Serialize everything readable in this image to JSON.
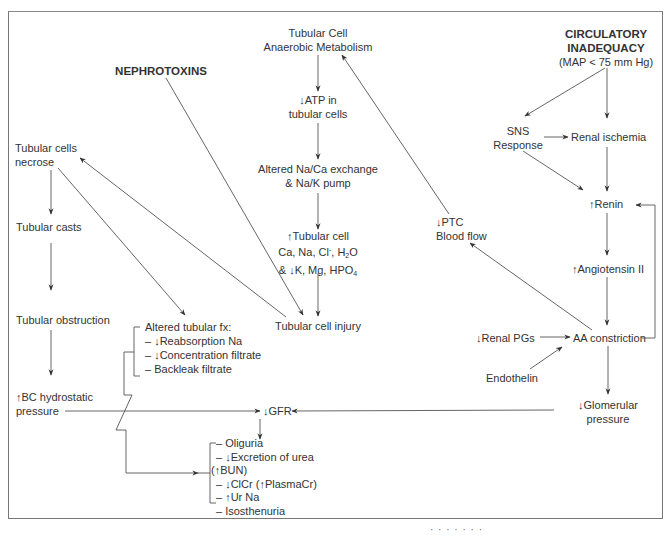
{
  "diagram": {
    "type": "pathophysiology flowchart",
    "nodes": {
      "circulatory": {
        "title_1": "CIRCULATORY",
        "title_2": "INADEQUACY",
        "subtitle": "(MAP < 75 mm Hg)"
      },
      "nephrotoxins": {
        "label": "NEPHROTOXINS"
      },
      "anaerobic": {
        "line1": "Tubular Cell",
        "line2": "Anaerobic Metabolism"
      },
      "atp": {
        "line1": "↓ATP in",
        "line2": "tubular cells"
      },
      "exchange": {
        "line1": "Altered Na/Ca exchange",
        "line2": "& Na/K pump"
      },
      "tubular_cell_ions": {
        "line1": "↑Tubular cell",
        "line2_a": "Ca, Na, Cl",
        "line2_sup": "-",
        "line2_b": ", H",
        "line2_sub": "2",
        "line2_c": "O",
        "line3_a": "& ↓K, Mg, HPO",
        "line3_sub": "4"
      },
      "tubular_cell_injury": {
        "label": "Tubular cell injury"
      },
      "necrose": {
        "line1": "Tubular cells",
        "line2": "necrose"
      },
      "casts": {
        "label": "Tubular casts"
      },
      "obstruction": {
        "label": "Tubular obstruction"
      },
      "bc_pressure": {
        "line1": "↑BC hydrostatic",
        "line2": "pressure"
      },
      "altered_fx": {
        "title": "Altered tubular fx:",
        "items": [
          "– ↓Reabsorption Na",
          "– ↓Concentration filtrate",
          "– Backleak filtrate"
        ]
      },
      "gfr": {
        "label": "↓GFR"
      },
      "outcomes": {
        "items": [
          "– Oliguria",
          "– ↓Excretion of urea",
          "(↑BUN)",
          "– ↓ClCr (↑PlasmaCr)",
          "– ↑Ur Na",
          "– Isosthenuria"
        ]
      },
      "sns": {
        "line1": "SNS",
        "line2": "Response"
      },
      "ischemia": {
        "label": "Renal ischemia"
      },
      "renin": {
        "label": "↑Renin"
      },
      "angiotensin": {
        "label": "↑Angiotensin II"
      },
      "ptc": {
        "line1": "↓PTC",
        "line2": "Blood flow"
      },
      "pgs": {
        "label": "↓Renal PGs"
      },
      "aa": {
        "label": "AA constriction"
      },
      "endothelin": {
        "label": "Endothelin"
      },
      "glomerular": {
        "line1": "↓Glomerular",
        "line2": "pressure"
      }
    },
    "edges": [
      [
        "circulatory",
        "sns"
      ],
      [
        "circulatory",
        "ischemia"
      ],
      [
        "sns",
        "ischemia"
      ],
      [
        "sns",
        "renin"
      ],
      [
        "ischemia",
        "renin"
      ],
      [
        "renin",
        "angiotensin"
      ],
      [
        "angiotensin",
        "aa"
      ],
      [
        "aa",
        "renin"
      ],
      [
        "pgs",
        "aa"
      ],
      [
        "endothelin",
        "aa"
      ],
      [
        "aa",
        "ptc"
      ],
      [
        "aa",
        "glomerular"
      ],
      [
        "ptc",
        "anaerobic"
      ],
      [
        "anaerobic",
        "atp"
      ],
      [
        "atp",
        "exchange"
      ],
      [
        "exchange",
        "tubular_cell_ions"
      ],
      [
        "tubular_cell_ions",
        "tubular_cell_injury"
      ],
      [
        "nephrotoxins",
        "tubular_cell_injury"
      ],
      [
        "tubular_cell_injury",
        "necrose"
      ],
      [
        "necrose",
        "casts"
      ],
      [
        "casts",
        "obstruction"
      ],
      [
        "obstruction",
        "bc_pressure"
      ],
      [
        "necrose",
        "altered_fx"
      ],
      [
        "bc_pressure",
        "gfr"
      ],
      [
        "glomerular",
        "gfr"
      ],
      [
        "gfr",
        "outcomes"
      ],
      [
        "altered_fx",
        "outcomes"
      ]
    ],
    "colors": {
      "line": "#555555",
      "text": "#333333",
      "frame": "#777777"
    },
    "bottom_fragment": "· · · · · · ·"
  }
}
